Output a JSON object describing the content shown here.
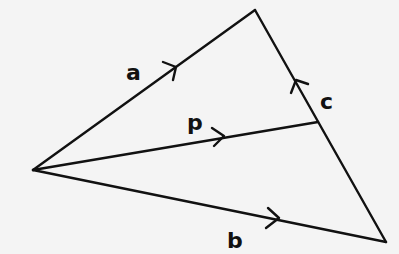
{
  "diagram": {
    "type": "vector-triangle",
    "stroke_color": "#111111",
    "background": "#f4f4f4",
    "points": {
      "O": {
        "x": 33,
        "y": 170
      },
      "A": {
        "x": 255,
        "y": 10
      },
      "B": {
        "x": 386,
        "y": 242
      },
      "P": {
        "x": 318,
        "y": 122
      }
    },
    "vectors": [
      {
        "name": "a",
        "label": "a",
        "from": "O",
        "to": "A",
        "label_pos": {
          "x": 126,
          "y": 80
        }
      },
      {
        "name": "p",
        "label": "p",
        "from": "O",
        "to": "P",
        "label_pos": {
          "x": 187,
          "y": 130
        }
      },
      {
        "name": "c",
        "label": "c",
        "from": "B",
        "to": "A",
        "label_pos": {
          "x": 320,
          "y": 109
        }
      },
      {
        "name": "b",
        "label": "b",
        "from": "O",
        "to": "B",
        "label_pos": {
          "x": 227,
          "y": 248
        }
      }
    ]
  }
}
